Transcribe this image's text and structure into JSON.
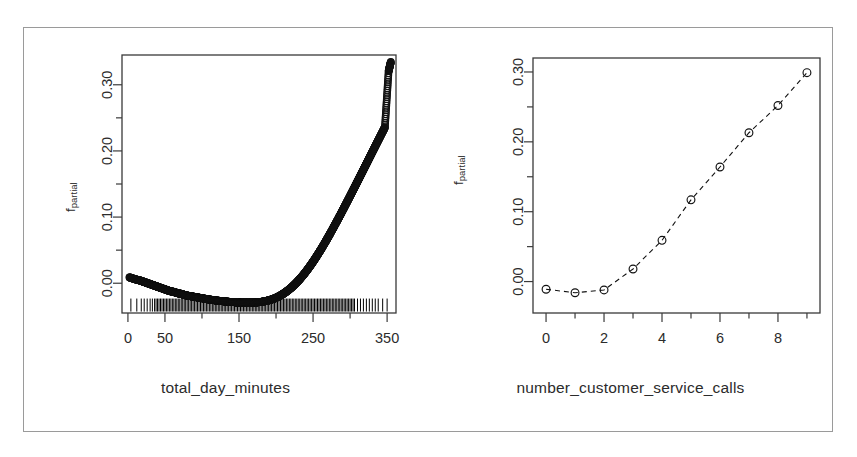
{
  "figure": {
    "title": "",
    "border_color": "#9a9a9a",
    "background": "#ffffff",
    "axis_color": "#3a3a3a",
    "point_color": "#111111"
  },
  "panels": [
    {
      "id": "left",
      "ylabel_main": "f",
      "ylabel_sub": "partial",
      "xlabel": "total_day_minutes"
    },
    {
      "id": "right",
      "ylabel_main": "f",
      "ylabel_sub": "partial",
      "xlabel": "number_customer_service_calls"
    }
  ],
  "chart_data": [
    {
      "type": "scatter",
      "id": "partial-dependence-total-day-minutes",
      "title": "",
      "xlabel": "total_day_minutes",
      "ylabel": "f_partial",
      "xlim": [
        -8,
        362
      ],
      "ylim": [
        -0.045,
        0.345
      ],
      "grid": false,
      "legend": null,
      "xticks": [
        0,
        50,
        100,
        150,
        200,
        250,
        300,
        350
      ],
      "xtick_labels": [
        "0",
        "50",
        "",
        "150",
        "",
        "250",
        "",
        "350"
      ],
      "yticks": [
        0.0,
        0.05,
        0.1,
        0.15,
        0.2,
        0.25,
        0.3
      ],
      "ytick_labels": [
        "0.00",
        "",
        "0.10",
        "",
        "0.20",
        "",
        "0.30"
      ],
      "marker": "open-circle",
      "rug": true,
      "rug_y": -0.033,
      "rug_values": [
        4,
        12,
        18,
        22,
        26,
        30,
        33,
        36,
        38,
        40,
        42,
        44,
        46,
        48,
        50,
        52,
        54,
        56,
        58,
        60,
        62,
        64,
        66,
        68,
        70,
        72,
        74,
        76,
        78,
        80,
        82,
        84,
        86,
        88,
        90,
        92,
        94,
        96,
        98,
        100,
        102,
        104,
        106,
        108,
        110,
        112,
        114,
        116,
        118,
        120,
        122,
        124,
        126,
        128,
        130,
        132,
        134,
        136,
        138,
        140,
        142,
        144,
        146,
        148,
        150,
        152,
        154,
        156,
        158,
        160,
        162,
        164,
        166,
        168,
        170,
        172,
        174,
        176,
        178,
        180,
        182,
        184,
        186,
        188,
        190,
        192,
        194,
        196,
        198,
        200,
        202,
        204,
        206,
        208,
        210,
        212,
        214,
        216,
        218,
        220,
        222,
        224,
        226,
        228,
        230,
        232,
        234,
        236,
        238,
        240,
        242,
        244,
        246,
        248,
        250,
        252,
        254,
        256,
        258,
        260,
        262,
        264,
        266,
        268,
        270,
        272,
        274,
        276,
        278,
        280,
        282,
        284,
        286,
        288,
        290,
        292,
        294,
        296,
        298,
        300,
        302,
        304,
        306,
        310,
        314,
        318,
        322,
        326,
        330,
        334,
        338,
        344,
        350
      ],
      "x": [
        2,
        10,
        17,
        22,
        27,
        32,
        37,
        42,
        47,
        52,
        57,
        62,
        67,
        72,
        77,
        82,
        87,
        92,
        97,
        102,
        107,
        112,
        117,
        122,
        127,
        132,
        137,
        142,
        147,
        152,
        157,
        162,
        167,
        172,
        177,
        182,
        187,
        192,
        197,
        202,
        207,
        212,
        217,
        222,
        227,
        232,
        237,
        242,
        247,
        252,
        257,
        262,
        267,
        272,
        277,
        282,
        287,
        292,
        297,
        302,
        307,
        312,
        317,
        322,
        327,
        332,
        337,
        342,
        347,
        352,
        355
      ],
      "y": [
        0.009,
        0.006,
        0.004,
        0.002,
        0.0,
        -0.002,
        -0.004,
        -0.006,
        -0.008,
        -0.01,
        -0.012,
        -0.013,
        -0.015,
        -0.016,
        -0.018,
        -0.019,
        -0.02,
        -0.021,
        -0.022,
        -0.023,
        -0.024,
        -0.0249,
        -0.0257,
        -0.0264,
        -0.027,
        -0.0276,
        -0.0281,
        -0.0285,
        -0.0289,
        -0.0292,
        -0.0294,
        -0.0295,
        -0.0294,
        -0.0291,
        -0.0286,
        -0.0278,
        -0.0267,
        -0.0252,
        -0.0233,
        -0.0208,
        -0.0178,
        -0.0142,
        -0.01,
        -0.0052,
        0.0002,
        0.0062,
        0.0128,
        0.02,
        0.0277,
        0.0359,
        0.0446,
        0.0537,
        0.0632,
        0.073,
        0.0831,
        0.0934,
        0.1039,
        0.1146,
        0.1254,
        0.1363,
        0.1473,
        0.1583,
        0.1694,
        0.1805,
        0.1916,
        0.2027,
        0.2138,
        0.2248,
        0.2358,
        0.3205,
        0.3345
      ],
      "note": "Dense scatter of open circles tracing a smooth U-then-rise partial dependence curve; many overlapping points form a thick band."
    },
    {
      "type": "line",
      "id": "partial-dependence-number-customer-service-calls",
      "title": "",
      "xlabel": "number_customer_service_calls",
      "ylabel": "f_partial",
      "xlim": [
        -0.45,
        9.45
      ],
      "ylim": [
        -0.045,
        0.32
      ],
      "grid": false,
      "legend": null,
      "xticks": [
        0,
        1,
        2,
        3,
        4,
        5,
        6,
        7,
        8,
        9
      ],
      "xtick_labels": [
        "0",
        "",
        "2",
        "",
        "4",
        "",
        "6",
        "",
        "8",
        ""
      ],
      "yticks": [
        0.0,
        0.05,
        0.1,
        0.15,
        0.2,
        0.25,
        0.3
      ],
      "ytick_labels": [
        "0.00",
        "",
        "0.10",
        "",
        "0.20",
        "",
        "0.30"
      ],
      "marker": "open-circle",
      "linestyle": "dashed",
      "x": [
        0,
        1,
        2,
        3,
        4,
        5,
        6,
        7,
        8,
        9
      ],
      "y": [
        -0.011,
        -0.016,
        -0.012,
        0.018,
        0.059,
        0.117,
        0.164,
        0.213,
        0.252,
        0.299
      ],
      "note": "Ten open circles joined by a dashed line rising from about -0.01 at 0 calls to about 0.30 at 9 calls."
    }
  ]
}
